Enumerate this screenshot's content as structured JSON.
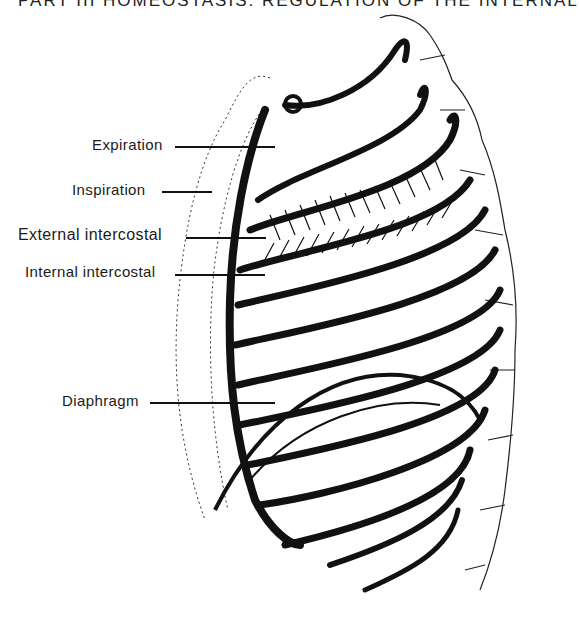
{
  "header": {
    "text": "PART III  HOMEOSTASIS: REGULATION OF THE INTERNAL"
  },
  "figure": {
    "labels": [
      {
        "id": "expiration",
        "text": "Expiration"
      },
      {
        "id": "inspiration",
        "text": "Inspiration"
      },
      {
        "id": "external-intercostal",
        "text": "External intercostal"
      },
      {
        "id": "internal-intercostal",
        "text": "Internal intercostal"
      },
      {
        "id": "diaphragm",
        "text": "Diaphragm"
      }
    ]
  },
  "colors": {
    "ink": "#111111",
    "background": "#ffffff"
  }
}
